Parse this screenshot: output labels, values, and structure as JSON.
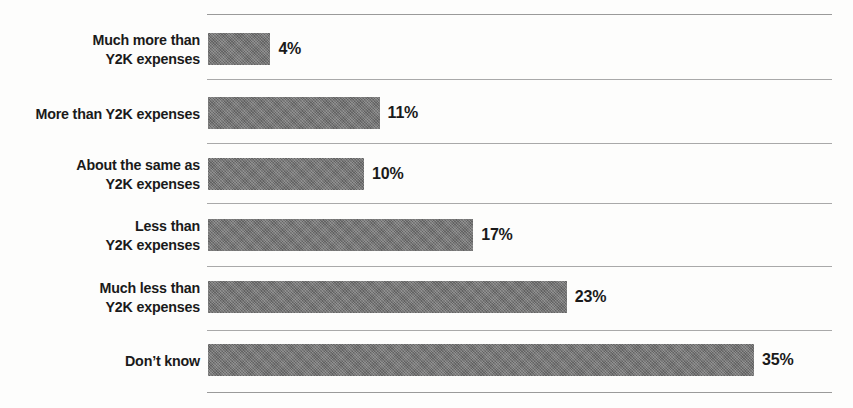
{
  "chart_data": {
    "type": "bar",
    "orientation": "horizontal",
    "title": "",
    "subtitle": "",
    "xlabel": "",
    "ylabel": "",
    "grid": true,
    "legend": "none",
    "xlim": [
      0,
      40
    ],
    "value_suffix": "%",
    "categories": [
      "Much more than\nY2K expenses",
      "More than Y2K expenses",
      "About the same as\nY2K expenses",
      "Less than\nY2K expenses",
      "Much less than\nY2K expenses",
      "Don’t know"
    ],
    "values": [
      4,
      11,
      10,
      17,
      23,
      35
    ],
    "value_labels": [
      "4%",
      "11%",
      "10%",
      "17%",
      "23%",
      "35%"
    ],
    "bar_color": "#6f6f6f",
    "gridline_color": "#9a9a9a",
    "background_color": "#fdfdfc",
    "text_color": "#1a1a1a"
  },
  "rows": [
    {
      "label": "Much more than\nY2K expenses",
      "value": 4,
      "value_label": "4%"
    },
    {
      "label": "More than Y2K expenses",
      "value": 11,
      "value_label": "11%"
    },
    {
      "label": "About the same as\nY2K expenses",
      "value": 10,
      "value_label": "10%"
    },
    {
      "label": "Less than\nY2K expenses",
      "value": 17,
      "value_label": "17%"
    },
    {
      "label": "Much less than\nY2K expenses",
      "value": 23,
      "value_label": "23%"
    },
    {
      "label": "Don’t know",
      "value": 35,
      "value_label": "35%"
    }
  ],
  "layout": {
    "plot_left": 208,
    "plot_right": 832,
    "px_per_percent": 15.6,
    "bar_height": 32,
    "gridlines_y": [
      14,
      79,
      143,
      203,
      266,
      330,
      392
    ],
    "bars_y": [
      33,
      97,
      158,
      219,
      281,
      344
    ]
  }
}
